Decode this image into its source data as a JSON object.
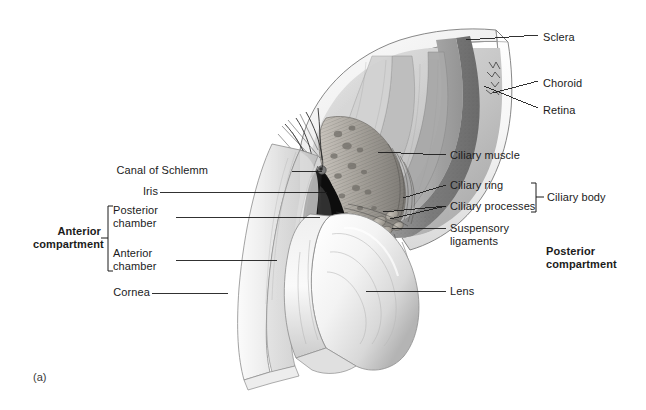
{
  "figure": {
    "panel_label": "(a)",
    "background_color": "#ffffff",
    "ink_color": "#1b1b1b"
  },
  "labels_right": [
    {
      "name": "sclera",
      "text": "Sclera",
      "x": 543,
      "y": 38
    },
    {
      "name": "choroid",
      "text": "Choroid",
      "x": 543,
      "y": 84
    },
    {
      "name": "retina",
      "text": "Retina",
      "x": 543,
      "y": 111
    },
    {
      "name": "ciliary-muscle",
      "text": "Ciliary muscle",
      "x": 450,
      "y": 157
    },
    {
      "name": "ciliary-ring",
      "text": "Ciliary ring",
      "x": 450,
      "y": 187
    },
    {
      "name": "ciliary-processes",
      "text": "Ciliary processes",
      "x": 450,
      "y": 208
    },
    {
      "name": "lens",
      "text": "Lens",
      "x": 450,
      "y": 293
    }
  ],
  "labels_right_multiline": [
    {
      "name": "suspensory-ligaments",
      "line1": "Suspensory",
      "line2": "ligaments",
      "x": 450,
      "y": 232
    }
  ],
  "labels_left": [
    {
      "name": "canal-of-schlemm",
      "text": "Canal of Schlemm",
      "x": 208,
      "y": 171
    },
    {
      "name": "iris",
      "text": "Iris",
      "x": 137,
      "y": 192
    },
    {
      "name": "cornea",
      "text": "Cornea",
      "x": 148,
      "y": 293
    }
  ],
  "labels_left_multiline": [
    {
      "name": "posterior-chamber",
      "line1": "Posterior",
      "line2": "chamber",
      "x": 113,
      "y": 211
    },
    {
      "name": "anterior-chamber",
      "line1": "Anterior",
      "line2": "chamber",
      "x": 113,
      "y": 254
    }
  ],
  "compartments": [
    {
      "name": "anterior-compartment",
      "line1": "Anterior",
      "line2": "compartment",
      "x": 33,
      "y": 232,
      "bold": true
    },
    {
      "name": "posterior-compartment",
      "line1": "Posterior",
      "line2": "compartment",
      "x": 546,
      "y": 252,
      "bold": true
    }
  ],
  "bracket_groups": [
    {
      "name": "ciliary-body",
      "text": "Ciliary body",
      "text_x": 547,
      "text_y": 191,
      "bracket_x": 536,
      "bracket_top": 183,
      "bracket_bottom": 212
    },
    {
      "name": "anterior-compartment-bracket",
      "text": "",
      "bracket_x": 108,
      "bracket_top": 206,
      "bracket_bottom": 271
    }
  ],
  "leader_lines": [
    {
      "name": "leader-sclera",
      "x1": 538,
      "y1": 35,
      "x2": 466,
      "y2": 40
    },
    {
      "name": "leader-choroid",
      "x1": 538,
      "y1": 81,
      "x2": 493,
      "y2": 93
    },
    {
      "name": "leader-retina",
      "x1": 538,
      "y1": 108,
      "x2": 483,
      "y2": 85
    },
    {
      "name": "leader-ciliary-muscle",
      "x1": 446,
      "y1": 155,
      "x2": 378,
      "y2": 152
    },
    {
      "name": "leader-ciliary-ring",
      "x1": 446,
      "y1": 185,
      "x2": 402,
      "y2": 197
    },
    {
      "name": "leader-ciliary-processes",
      "x1": 446,
      "y1": 206,
      "x2": 388,
      "y2": 218
    },
    {
      "name": "leader-ciliary-processes-2",
      "x1": 446,
      "y1": 206,
      "x2": 382,
      "y2": 212
    },
    {
      "name": "leader-suspensory",
      "x1": 446,
      "y1": 228,
      "x2": 393,
      "y2": 228
    },
    {
      "name": "leader-lens",
      "x1": 446,
      "y1": 291,
      "x2": 366,
      "y2": 291
    },
    {
      "name": "leader-canal-of-schlemm",
      "x1": 290,
      "y1": 171,
      "x2": 322,
      "y2": 171
    },
    {
      "name": "leader-iris",
      "x1": 160,
      "y1": 192,
      "x2": 327,
      "y2": 192
    },
    {
      "name": "leader-posterior-chamber",
      "x1": 175,
      "y1": 217,
      "x2": 320,
      "y2": 217
    },
    {
      "name": "leader-anterior-chamber",
      "x1": 175,
      "y1": 260,
      "x2": 277,
      "y2": 260
    },
    {
      "name": "leader-cornea",
      "x1": 150,
      "y1": 293,
      "x2": 228,
      "y2": 293
    }
  ],
  "anatomy_regions": [
    {
      "name": "sclera-wall",
      "tone": "#f2f2f2"
    },
    {
      "name": "choroid-layer",
      "tone": "#8e8e8e"
    },
    {
      "name": "retina-layer",
      "tone": "#b9b9b9"
    },
    {
      "name": "ciliary-muscle-body",
      "tone": "#9a9a9a"
    },
    {
      "name": "iris-body",
      "tone": "#161616"
    },
    {
      "name": "lens-body",
      "tone": "#efefef"
    },
    {
      "name": "cornea-body",
      "tone": "#e4e4e4"
    },
    {
      "name": "vitreous-cavity",
      "tone": "#c8c8c8"
    }
  ]
}
